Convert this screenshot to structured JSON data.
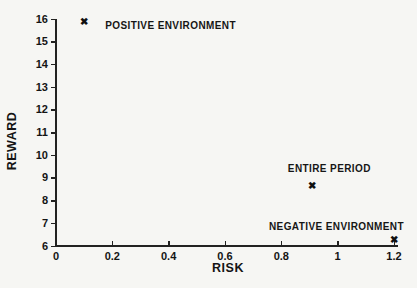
{
  "figure": {
    "background": "#f6f6f3",
    "ink": "#141414"
  },
  "chart_data": {
    "type": "scatter",
    "title": "",
    "xlabel": "RISK",
    "ylabel": "REWARD",
    "xlim": [
      0,
      1.2
    ],
    "ylim": [
      6,
      16
    ],
    "grid": false,
    "legend": "none",
    "marker_glyph": "✖",
    "x_ticks": {
      "values": [
        0,
        0.2,
        0.4,
        0.6,
        0.8,
        1,
        1.2
      ],
      "labels": [
        "0",
        "0.2",
        "0.4",
        "0.6",
        "0.8",
        "1",
        "1.2"
      ]
    },
    "y_ticks": {
      "values": [
        6,
        7,
        8,
        9,
        10,
        11,
        12,
        13,
        14,
        15,
        16
      ],
      "labels": [
        "6",
        "7",
        "8",
        "9",
        "10",
        "11",
        "12",
        "13",
        "14",
        "15",
        "16"
      ]
    },
    "points": [
      {
        "label": "POSITIVE ENVIRONMENT",
        "x": 0.1,
        "y": 15.85,
        "label_pos": "right"
      },
      {
        "label": "ENTIRE PERIOD",
        "x": 0.91,
        "y": 8.65,
        "label_pos": "above"
      },
      {
        "label": "NEGATIVE ENVIRONMENT",
        "x": 1.2,
        "y": 6.28,
        "label_pos": "above-left"
      }
    ]
  }
}
